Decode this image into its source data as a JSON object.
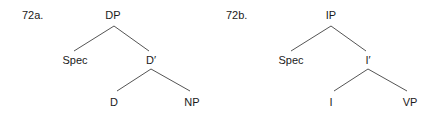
{
  "trees": [
    {
      "label": "72a.",
      "root": "DP",
      "spec": "Spec",
      "bar": "D′",
      "head": "D",
      "complement": "NP"
    },
    {
      "label": "72b.",
      "root": "IP",
      "spec": "Spec",
      "bar": "I′",
      "head": "I",
      "complement": "VP"
    }
  ],
  "colors": {
    "text": "#1a1a1a",
    "edge": "#555555",
    "background": "#ffffff"
  }
}
